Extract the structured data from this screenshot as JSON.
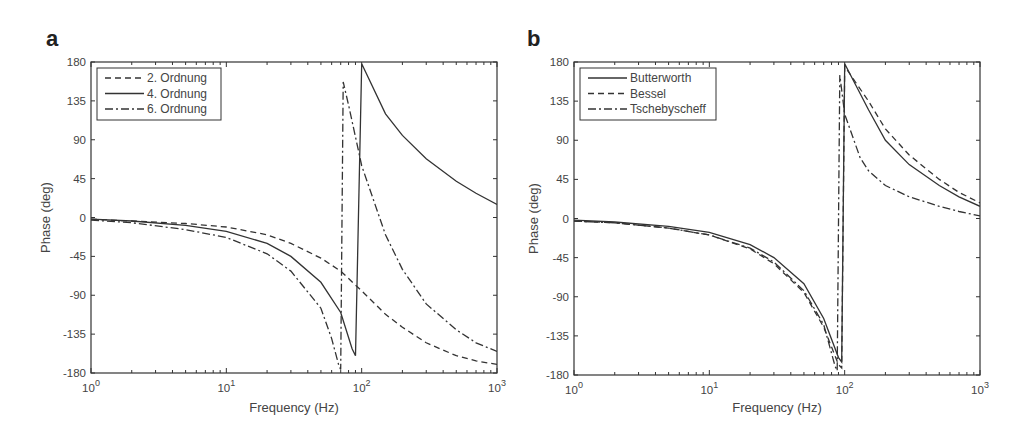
{
  "panels": [
    {
      "label": "a"
    },
    {
      "label": "b"
    }
  ],
  "chart_data": [
    {
      "type": "line",
      "panel": "a",
      "title": "",
      "xlabel": "Frequency  (Hz)",
      "ylabel": "Phase (deg)",
      "xscale": "log",
      "xlim": [
        1,
        1000
      ],
      "ylim": [
        -180,
        180
      ],
      "xticks": [
        "10^0",
        "10^1",
        "10^2",
        "10^3"
      ],
      "yticks": [
        180,
        135,
        90,
        45,
        0,
        -45,
        -90,
        -135,
        -180
      ],
      "grid": false,
      "legend_position": "upper left",
      "series": [
        {
          "name": "2. Ordnung",
          "style": "dashed",
          "x": [
            1,
            2,
            5,
            10,
            20,
            30,
            50,
            70,
            100,
            150,
            200,
            300,
            500,
            700,
            1000
          ],
          "y": [
            -2,
            -4,
            -7,
            -11,
            -20,
            -30,
            -47,
            -62,
            -85,
            -112,
            -127,
            -145,
            -160,
            -166,
            -170
          ]
        },
        {
          "name": "4. Ordnung",
          "style": "solid",
          "x": [
            1,
            2,
            5,
            10,
            20,
            30,
            50,
            70,
            85,
            90,
            100,
            150,
            200,
            300,
            500,
            700,
            1000
          ],
          "y": [
            -2,
            -4,
            -9,
            -16,
            -30,
            -45,
            -75,
            -110,
            -152,
            -160,
            178,
            120,
            95,
            68,
            42,
            28,
            15
          ]
        },
        {
          "name": "6. Ordnung",
          "style": "dashdot",
          "x": [
            1,
            2,
            5,
            10,
            20,
            30,
            50,
            60,
            68,
            70,
            73,
            80,
            100,
            150,
            200,
            300,
            500,
            700,
            1000
          ],
          "y": [
            -3,
            -6,
            -14,
            -23,
            -42,
            -62,
            -105,
            -140,
            -172,
            -176,
            157,
            130,
            60,
            -20,
            -60,
            -100,
            -130,
            -145,
            -155
          ]
        }
      ]
    },
    {
      "type": "line",
      "panel": "b",
      "title": "",
      "xlabel": "Frequency  (Hz)",
      "ylabel": "Phase (deg)",
      "xscale": "log",
      "xlim": [
        1,
        1000
      ],
      "ylim": [
        -180,
        180
      ],
      "xticks": [
        "10^0",
        "10^1",
        "10^2",
        "10^3"
      ],
      "yticks": [
        180,
        135,
        90,
        45,
        0,
        -45,
        -90,
        -135,
        -180
      ],
      "grid": false,
      "legend_position": "upper left",
      "series": [
        {
          "name": "Butterworth",
          "style": "solid",
          "x": [
            1,
            2,
            5,
            10,
            20,
            30,
            50,
            70,
            90,
            95,
            100,
            150,
            200,
            300,
            500,
            700,
            1000
          ],
          "y": [
            -2,
            -4,
            -9,
            -16,
            -30,
            -45,
            -75,
            -115,
            -160,
            -165,
            178,
            125,
            90,
            62,
            38,
            25,
            14
          ]
        },
        {
          "name": "Bessel",
          "style": "dashed",
          "x": [
            1,
            2,
            5,
            10,
            20,
            30,
            50,
            70,
            90,
            95,
            100,
            150,
            200,
            300,
            500,
            700,
            1000
          ],
          "y": [
            -3,
            -5,
            -11,
            -19,
            -35,
            -52,
            -85,
            -125,
            -168,
            -172,
            175,
            135,
            103,
            73,
            45,
            30,
            18
          ]
        },
        {
          "name": "Tschebyscheff",
          "style": "dashdot",
          "x": [
            1,
            2,
            5,
            10,
            20,
            30,
            50,
            70,
            85,
            88,
            92,
            100,
            130,
            150,
            200,
            300,
            500,
            700,
            1000
          ],
          "y": [
            -3,
            -5,
            -11,
            -19,
            -34,
            -50,
            -83,
            -122,
            -170,
            -175,
            165,
            120,
            70,
            55,
            38,
            25,
            14,
            8,
            3
          ]
        }
      ]
    }
  ]
}
